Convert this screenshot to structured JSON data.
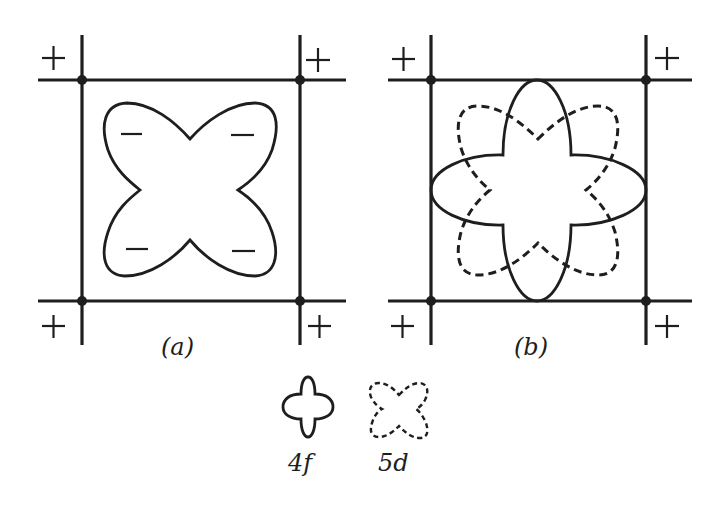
{
  "figure": {
    "panels": [
      {
        "id": "a",
        "label": "(a)",
        "description": "Lobes of an orbital pointing between ligand positions; ligands on corners carry positive charge, orbital lobes carry negative sign",
        "corner_signs": [
          "+",
          "+",
          "+",
          "+"
        ],
        "lobe_signs": [
          "−",
          "−",
          "−",
          "−"
        ]
      },
      {
        "id": "b",
        "label": "(b)",
        "description": "Overlay of 4f (solid) and 5d (dashed) orbital shapes in the same ligand square",
        "corner_signs": [
          "+",
          "+",
          "+",
          "+"
        ]
      }
    ],
    "legend": [
      {
        "name": "4f",
        "label": "4f",
        "style": "solid"
      },
      {
        "name": "5d",
        "label": "5d",
        "style": "dashed"
      }
    ]
  }
}
